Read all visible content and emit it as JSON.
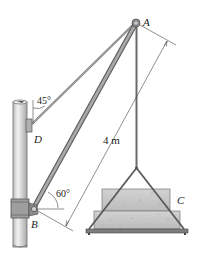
{
  "figure": {
    "type": "mechanics-diagram"
  },
  "labels": {
    "point_a": "A",
    "point_b": "B",
    "point_c": "C",
    "point_d": "D"
  },
  "angles": {
    "cable_angle": "45°",
    "boom_angle": "60°"
  },
  "dimensions": {
    "boom_length": "4 m"
  },
  "colors": {
    "member": "#8a8a8a",
    "member_dark": "#5f5f5f",
    "pole": "#d9d9d9",
    "load": "#c8c8c8",
    "line": "#333333"
  }
}
